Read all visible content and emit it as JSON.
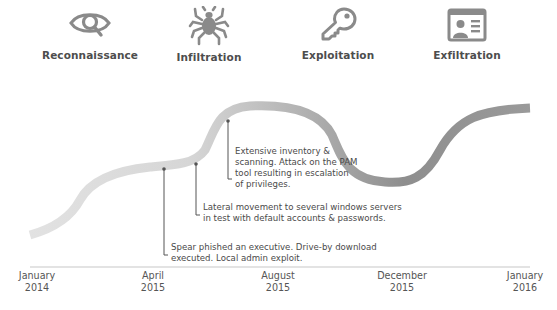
{
  "stages": [
    {
      "label": "Reconnaissance",
      "icon": "eye-magnifier-icon"
    },
    {
      "label": "Infiltration",
      "icon": "spider-icon"
    },
    {
      "label": "Exploitation",
      "icon": "key-icon"
    },
    {
      "label": "Exfiltration",
      "icon": "id-card-icon"
    }
  ],
  "annotations": [
    {
      "text": "Extensive inventory &\nscanning. Attack on the PAM\ntool resulting in escalation\nof privileges."
    },
    {
      "text": "Lateral movement to several windows servers\nin test with default accounts & passwords."
    },
    {
      "text": "Spear phished an executive.  Drive-by download\nexecuted. Local admin exploit."
    }
  ],
  "timeline": {
    "ticks": [
      {
        "month": "January",
        "year": "2014"
      },
      {
        "month": "April",
        "year": "2015"
      },
      {
        "month": "August",
        "year": "2015"
      },
      {
        "month": "December",
        "year": "2015"
      },
      {
        "month": "January",
        "year": "2016"
      }
    ]
  },
  "colors": {
    "curve_start": "#dcdcdc",
    "curve_mid": "#bdbdbd",
    "curve_end": "#8c8c8c",
    "icon": "#8a8a8a",
    "text": "#4a4a4a",
    "leader": "#555555",
    "baseline": "#c8c8c8"
  }
}
